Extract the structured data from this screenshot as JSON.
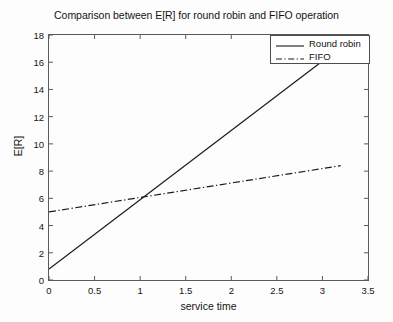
{
  "chart_data": {
    "type": "line",
    "title": "Comparison between E[R] for round robin and FIFO operation",
    "xlabel": "service time",
    "ylabel": "E[R]",
    "xlim": [
      0,
      3.5
    ],
    "ylim": [
      0,
      18
    ],
    "xticks": [
      "0",
      "0.5",
      "1",
      "1.5",
      "2",
      "2.5",
      "3",
      "3.5"
    ],
    "xtick_values": [
      0,
      0.5,
      1,
      1.5,
      2,
      2.5,
      3,
      3.5
    ],
    "yticks": [
      "0",
      "2",
      "4",
      "6",
      "8",
      "10",
      "12",
      "14",
      "16",
      "18"
    ],
    "ytick_values": [
      0,
      2,
      4,
      6,
      8,
      10,
      12,
      14,
      16,
      18
    ],
    "grid": false,
    "legend_position": "upper right",
    "series": [
      {
        "name": "Round robin",
        "style": "solid",
        "color": "#1a1a1a",
        "x": [
          0,
          3.2
        ],
        "y": [
          0.8,
          17.1
        ]
      },
      {
        "name": "FIFO",
        "style": "dash-dot",
        "color": "#1a1a1a",
        "x": [
          0,
          3.2
        ],
        "y": [
          5.0,
          8.4
        ]
      }
    ],
    "annotations": {
      "intersection_x": 1.0,
      "intersection_y": 6.0
    }
  },
  "legend": {
    "items": [
      {
        "label": "Round robin",
        "style": "solid"
      },
      {
        "label": "FIFO",
        "style": "dash-dot"
      }
    ]
  }
}
